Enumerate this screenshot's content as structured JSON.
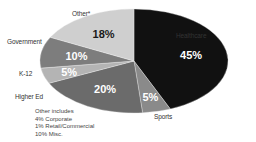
{
  "chart_data": {
    "type": "pie",
    "title": "",
    "start_angle_deg": 0,
    "direction": "clockwise",
    "slices": [
      {
        "label": "Healthcare",
        "value": 45,
        "display": "45%",
        "color": "#111111",
        "text_color": "#ffffff",
        "label_pos": [
          227,
          47
        ]
      },
      {
        "label": "Sports",
        "value": 5,
        "display": "5%",
        "color": "#8a8a8a",
        "text_color": "#ffffff",
        "label_pos": [
          152,
          110
        ]
      },
      {
        "label": "Higher Ed",
        "value": 20,
        "display": "20%",
        "color": "#6b6b6b",
        "text_color": "#ffffff",
        "label_pos": [
          18,
          90
        ]
      },
      {
        "label": "K-12",
        "value": 5,
        "display": "5%",
        "color": "#b4b4b4",
        "text_color": "#ffffff",
        "label_pos": [
          16,
          66
        ]
      },
      {
        "label": "Government",
        "value": 10,
        "display": "10%",
        "color": "#7d7d7d",
        "text_color": "#ffffff",
        "label_pos": [
          6,
          44
        ]
      },
      {
        "label": "Other*",
        "value": 18,
        "display": "18%",
        "color": "#cfcfcf",
        "text_color": "#1a1a1a",
        "label_pos": [
          72,
          13
        ]
      }
    ],
    "footnote": {
      "title": "Other includes",
      "items": [
        "4%  Corporate",
        "1%  Retail/Commercial",
        "10%  Misc."
      ]
    }
  },
  "labels": {
    "healthcare": "Healthcare",
    "sports": "Sports",
    "higher_ed": "Higher Ed",
    "k12": "K-12",
    "government": "Government",
    "other": "Other*"
  },
  "footnote": {
    "title": "Other includes",
    "line1": "4%  Corporate",
    "line2": "1%  Retail/Commercial",
    "line3": "10%  Misc."
  }
}
